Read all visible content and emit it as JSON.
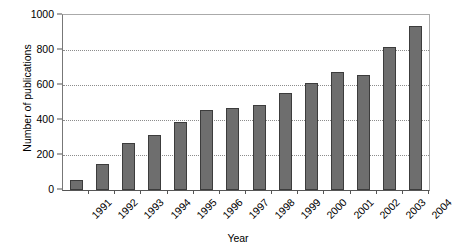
{
  "chart_data": {
    "type": "bar",
    "title": "",
    "xlabel": "Year",
    "ylabel": "Number of publications",
    "categories": [
      "1991",
      "1992",
      "1993",
      "1994",
      "1995",
      "1996",
      "1997",
      "1998",
      "1999",
      "2000",
      "2001",
      "2002",
      "2003",
      "2004"
    ],
    "values": [
      60,
      150,
      270,
      315,
      390,
      460,
      470,
      485,
      555,
      610,
      675,
      660,
      815,
      935
    ],
    "ylim": [
      0,
      1000
    ],
    "yticks": [
      0,
      200,
      400,
      600,
      800,
      1000
    ],
    "ytick_labels": [
      "0",
      "200",
      "400",
      "600",
      "800",
      "1000"
    ],
    "grid": "horizontal-dotted",
    "gridlines_at": [
      200,
      400,
      600,
      800
    ],
    "legend": "none",
    "bar_color": "#6e6e6e",
    "bar_edge_color": "#3c3c3c",
    "gridline_color": "#8c8c8c",
    "axis_color": "#555555",
    "background": "#ffffff",
    "xtick_label_rotation": "-45"
  }
}
